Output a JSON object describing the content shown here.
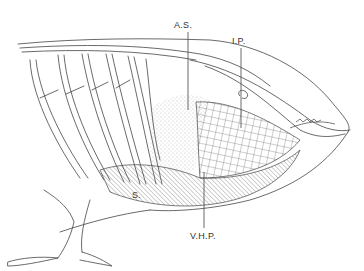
{
  "figure": {
    "labels": {
      "as": "A.S.",
      "ip": "I.P.",
      "s": "S.",
      "vhp": "V.H.P."
    },
    "colors": {
      "line": "#444444",
      "background": "#ffffff"
    }
  }
}
